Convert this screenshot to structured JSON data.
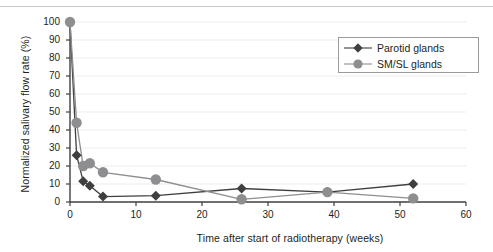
{
  "figure": {
    "bottom_fragment": "",
    "colors": {
      "parotid": "#3f3f42",
      "smsl": "#8e8e90",
      "axis": "#3f3f42",
      "grid": "#ededed",
      "legend_border": "#9b9b9b",
      "text": "#231f20"
    }
  },
  "legend": {
    "position": "top-right",
    "entries": [
      {
        "label": "Parotid glands",
        "marker": "diamond-marker",
        "color": "#3f3f42"
      },
      {
        "label": "SM/SL glands",
        "marker": "circle-marker",
        "color": "#8e8e90"
      }
    ]
  },
  "chart_data": {
    "type": "line",
    "title": "",
    "subtitle": "",
    "xlabel": "Time after start of radiotherapy (weeks)",
    "ylabel": "Normalized salivary flow rate (%)",
    "xlim": [
      0,
      60
    ],
    "ylim": [
      0,
      100
    ],
    "xticks": [
      0,
      10,
      20,
      30,
      40,
      50,
      60
    ],
    "yticks": [
      0,
      10,
      20,
      30,
      40,
      50,
      60,
      70,
      80,
      90,
      100
    ],
    "xtick_labels": [
      "0",
      "10",
      "20",
      "30",
      "40",
      "50",
      "60"
    ],
    "ytick_labels": [
      "0",
      "10",
      "20",
      "30",
      "40",
      "50",
      "60",
      "70",
      "80",
      "90",
      "100"
    ],
    "grid": "horizontal",
    "legend_position": "top-right",
    "series": [
      {
        "name": "Parotid glands",
        "marker": "diamond",
        "color": "#3f3f42",
        "x": [
          0,
          1,
          2,
          3,
          5,
          13,
          26,
          39,
          52
        ],
        "y": [
          100,
          26,
          11.5,
          9,
          3,
          3.5,
          7.5,
          5.5,
          10
        ]
      },
      {
        "name": "SM/SL glands",
        "marker": "circle",
        "color": "#8e8e90",
        "x": [
          0,
          1,
          2,
          3,
          5,
          13,
          26,
          39,
          52
        ],
        "y": [
          100,
          44,
          20,
          21.5,
          16.5,
          12.5,
          1.5,
          5.5,
          2
        ]
      }
    ]
  }
}
